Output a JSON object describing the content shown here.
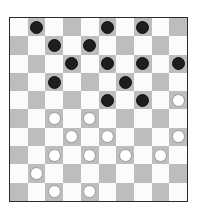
{
  "board": {
    "size": 10,
    "colors": {
      "light": "#fbfbfb",
      "dark": "#bdbdbd",
      "border": "#2a2a2a",
      "black_piece": "#1e1e1e",
      "white_piece": "#ffffff"
    },
    "pieces": [
      {
        "row": 0,
        "col": 1,
        "color": "black"
      },
      {
        "row": 0,
        "col": 5,
        "color": "black"
      },
      {
        "row": 0,
        "col": 7,
        "color": "black"
      },
      {
        "row": 1,
        "col": 2,
        "color": "black"
      },
      {
        "row": 1,
        "col": 4,
        "color": "black"
      },
      {
        "row": 2,
        "col": 3,
        "color": "black"
      },
      {
        "row": 2,
        "col": 5,
        "color": "black"
      },
      {
        "row": 2,
        "col": 7,
        "color": "black"
      },
      {
        "row": 2,
        "col": 9,
        "color": "black"
      },
      {
        "row": 3,
        "col": 2,
        "color": "black"
      },
      {
        "row": 3,
        "col": 6,
        "color": "black"
      },
      {
        "row": 4,
        "col": 5,
        "color": "black"
      },
      {
        "row": 4,
        "col": 7,
        "color": "black"
      },
      {
        "row": 4,
        "col": 9,
        "color": "white"
      },
      {
        "row": 5,
        "col": 2,
        "color": "white"
      },
      {
        "row": 5,
        "col": 4,
        "color": "white"
      },
      {
        "row": 6,
        "col": 3,
        "color": "white"
      },
      {
        "row": 6,
        "col": 5,
        "color": "white"
      },
      {
        "row": 6,
        "col": 9,
        "color": "white"
      },
      {
        "row": 7,
        "col": 2,
        "color": "white"
      },
      {
        "row": 7,
        "col": 4,
        "color": "white"
      },
      {
        "row": 7,
        "col": 6,
        "color": "white"
      },
      {
        "row": 7,
        "col": 8,
        "color": "white"
      },
      {
        "row": 8,
        "col": 1,
        "color": "white"
      },
      {
        "row": 9,
        "col": 2,
        "color": "white"
      },
      {
        "row": 9,
        "col": 4,
        "color": "white"
      }
    ]
  }
}
